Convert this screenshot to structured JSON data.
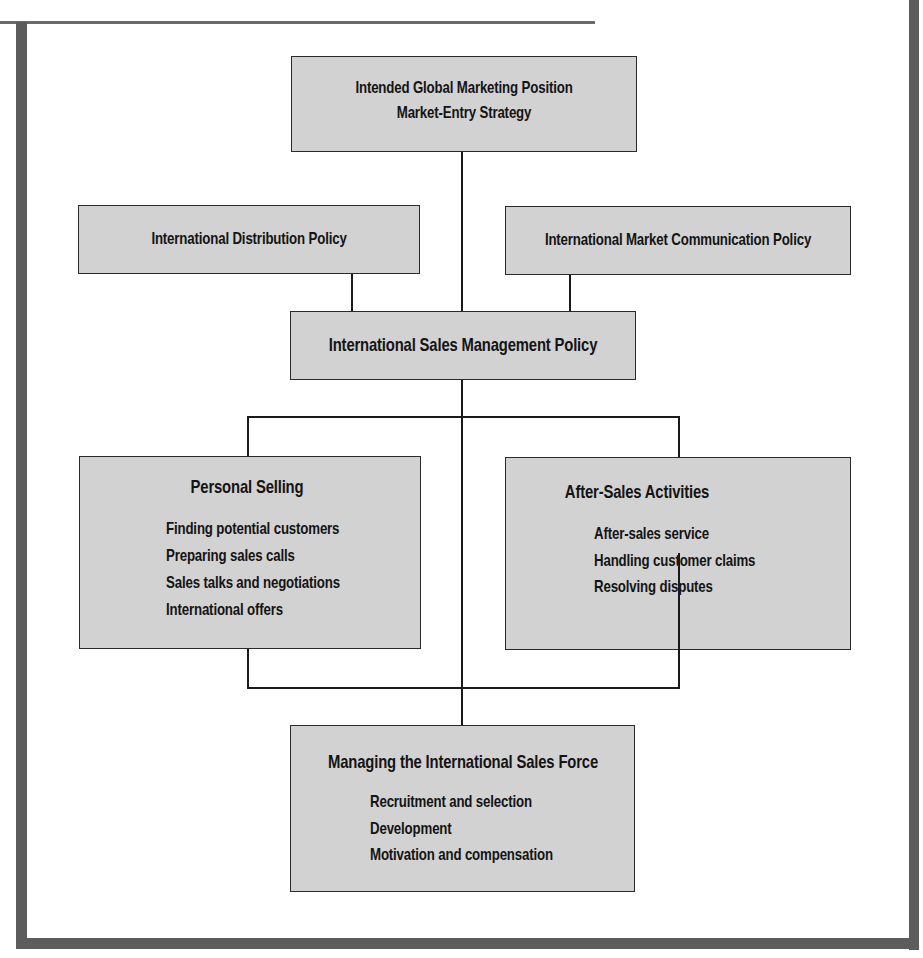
{
  "diagram": {
    "type": "hierarchy-flowchart",
    "nodes": {
      "global_position": {
        "lines": [
          "Intended Global Marketing Position",
          "Market-Entry Strategy"
        ]
      },
      "distribution_policy": {
        "label": "International Distribution Policy"
      },
      "communication_policy": {
        "label": "International Market Communication Policy"
      },
      "sales_management_policy": {
        "label": "International Sales Management Policy"
      },
      "personal_selling": {
        "title": "Personal Selling",
        "items": [
          "Finding potential customers",
          "Preparing sales calls",
          "Sales talks and negotiations",
          "International offers"
        ]
      },
      "after_sales": {
        "title": "After-Sales Activities",
        "items": [
          "After-sales service",
          "Handling customer claims",
          "Resolving disputes"
        ]
      },
      "sales_force": {
        "title": "Managing the International Sales Force",
        "items": [
          "Recruitment and selection",
          "Development",
          "Motivation and compensation"
        ]
      }
    },
    "edges": [
      {
        "from": "global_position",
        "to": "sales_management_policy"
      },
      {
        "from": "distribution_policy",
        "to": "sales_management_policy"
      },
      {
        "from": "communication_policy",
        "to": "sales_management_policy"
      },
      {
        "from": "sales_management_policy",
        "to": "personal_selling"
      },
      {
        "from": "sales_management_policy",
        "to": "after_sales"
      },
      {
        "from": "sales_management_policy",
        "to": "sales_force"
      },
      {
        "from": "personal_selling",
        "to": "sales_force"
      },
      {
        "from": "after_sales",
        "to": "sales_force"
      }
    ],
    "colors": {
      "box_fill": "#d2d2d2",
      "frame": "#5c5c5c",
      "line": "#1a1a1a"
    }
  }
}
